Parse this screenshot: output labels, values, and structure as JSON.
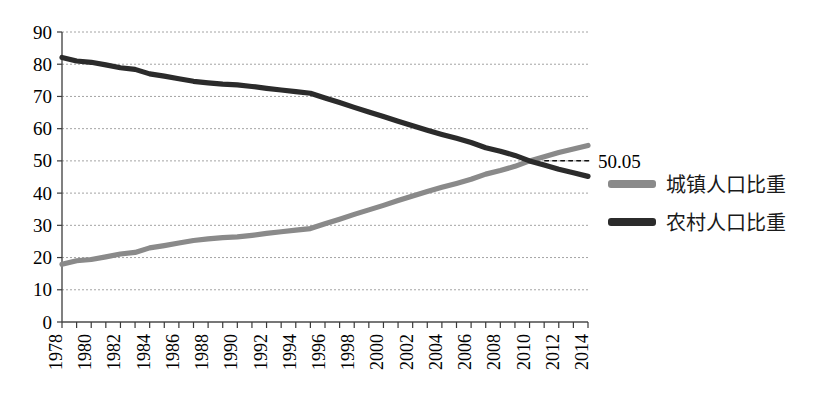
{
  "chart_data": {
    "type": "line",
    "title": "",
    "subtitle": "",
    "xlabel": "",
    "ylabel": "",
    "xlim": [
      1978,
      2014
    ],
    "ylim": [
      0,
      90
    ],
    "y_ticks": [
      0,
      10,
      20,
      30,
      40,
      50,
      60,
      70,
      80,
      90
    ],
    "x_tick_labels": [
      "1978",
      "1980",
      "1982",
      "1984",
      "1986",
      "1988",
      "1990",
      "1992",
      "1994",
      "1996",
      "1998",
      "2000",
      "2002",
      "2004",
      "2006",
      "2008",
      "2010",
      "2012",
      "2014"
    ],
    "x": [
      1978,
      1979,
      1980,
      1981,
      1982,
      1983,
      1984,
      1985,
      1986,
      1987,
      1988,
      1989,
      1990,
      1991,
      1992,
      1993,
      1994,
      1995,
      1996,
      1997,
      1998,
      1999,
      2000,
      2001,
      2002,
      2003,
      2004,
      2005,
      2006,
      2007,
      2008,
      2009,
      2010,
      2011,
      2012,
      2013,
      2014
    ],
    "grid": true,
    "grid_axis": "y",
    "legend_position": "right",
    "series": [
      {
        "name": "城镇人口比重",
        "color": "#8a8a8a",
        "values": [
          17.9,
          19.0,
          19.4,
          20.2,
          21.1,
          21.6,
          23.0,
          23.7,
          24.5,
          25.3,
          25.8,
          26.2,
          26.4,
          26.9,
          27.5,
          28.0,
          28.5,
          29.0,
          30.5,
          31.9,
          33.4,
          34.8,
          36.2,
          37.7,
          39.1,
          40.5,
          41.8,
          43.0,
          44.3,
          45.9,
          47.0,
          48.3,
          50.0,
          51.3,
          52.6,
          53.7,
          54.8
        ]
      },
      {
        "name": "农村人口比重",
        "color": "#2b2b2b",
        "values": [
          82.1,
          81.0,
          80.6,
          79.8,
          78.9,
          78.4,
          77.0,
          76.3,
          75.5,
          74.7,
          74.2,
          73.8,
          73.6,
          73.1,
          72.5,
          72.0,
          71.5,
          71.0,
          69.5,
          68.1,
          66.6,
          65.2,
          63.8,
          62.3,
          60.9,
          59.5,
          58.2,
          57.0,
          55.7,
          54.1,
          53.0,
          51.7,
          50.0,
          48.7,
          47.4,
          46.3,
          45.2
        ]
      }
    ],
    "annotations": [
      {
        "text": "50.05",
        "x": 2011,
        "y": 50.05,
        "note": "crossover value label with dashed leader line"
      }
    ]
  },
  "legend": {
    "entries": [
      {
        "label": "城镇人口比重",
        "color": "#8a8a8a"
      },
      {
        "label": "农村人口比重",
        "color": "#2b2b2b"
      }
    ]
  },
  "colors": {
    "urban": "#8a8a8a",
    "rural": "#2b2b2b",
    "grid": "#9a9a9a",
    "axis": "#4a4a4a",
    "background": "#ffffff",
    "text": "#000000"
  }
}
